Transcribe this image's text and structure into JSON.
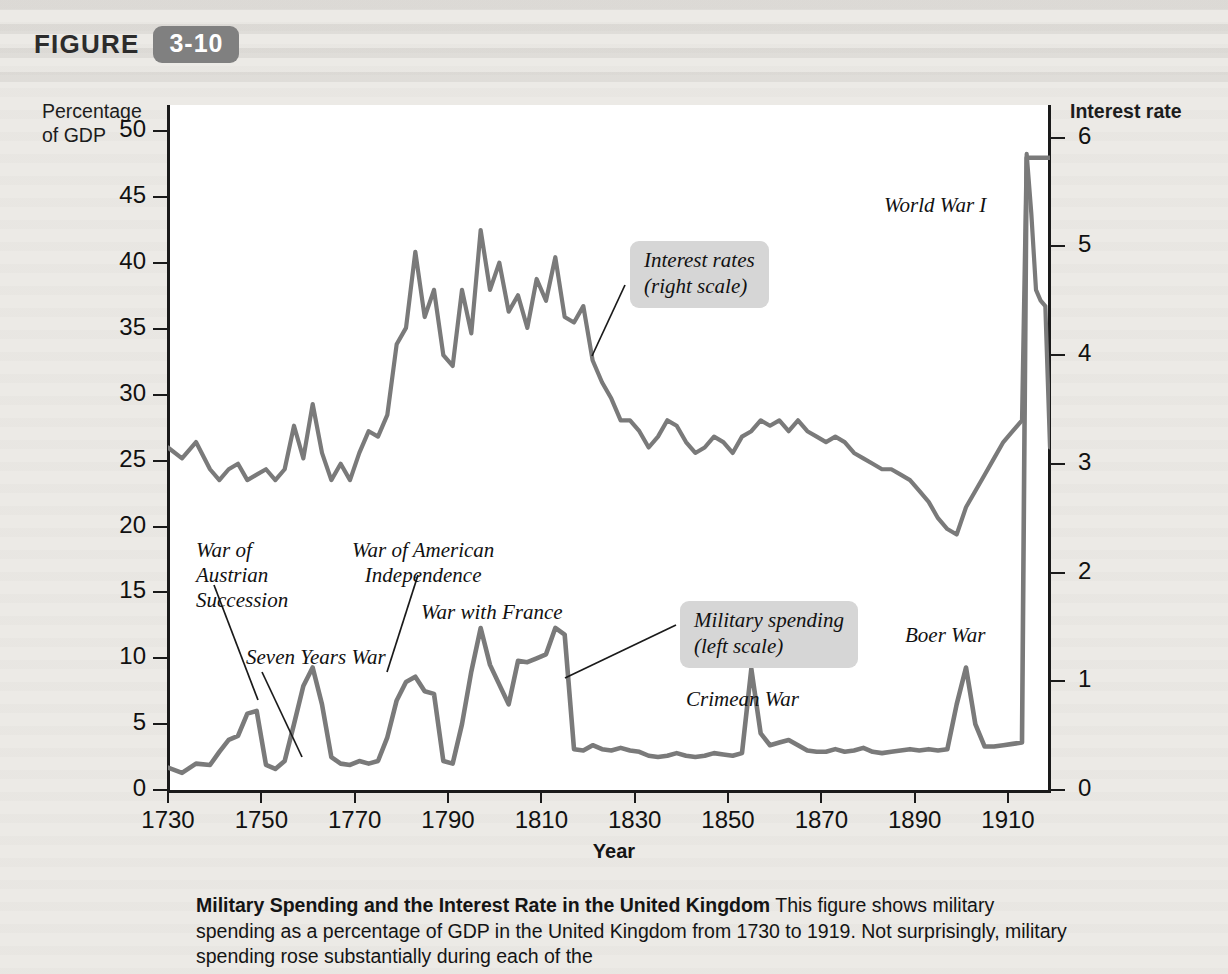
{
  "figure": {
    "word": "FIGURE",
    "number": "3-10",
    "badge_color": "#808080"
  },
  "caption": {
    "title": "Military Spending and the Interest Rate in the United Kingdom",
    "body": " This figure shows military spending as a percentage of GDP in the United Kingdom from 1730 to 1919. Not surprisingly, military spending rose substantially during each of the"
  },
  "chart_data": {
    "type": "line",
    "title": "Military Spending and the Interest Rate in the United Kingdom",
    "xlabel": "Year",
    "ylabel_left": "Percentage of GDP",
    "ylabel_right": "Interest rate",
    "grid": false,
    "legend_position": "inline-callouts",
    "line_color": "#7a7a7a",
    "xlim": [
      1730,
      1919
    ],
    "xticks": [
      1730,
      1750,
      1770,
      1790,
      1810,
      1830,
      1850,
      1870,
      1890,
      1910
    ],
    "left_axis": {
      "ylim": [
        0,
        52
      ],
      "yticks": [
        0,
        5,
        10,
        15,
        20,
        25,
        30,
        35,
        40,
        45,
        50
      ]
    },
    "right_axis": {
      "ylim": [
        0,
        6.3
      ],
      "yticks": [
        0,
        1,
        2,
        3,
        4,
        5,
        6
      ]
    },
    "series": [
      {
        "name": "Interest rates (right scale)",
        "axis": "right",
        "x": [
          1730,
          1733,
          1736,
          1739,
          1741,
          1743,
          1745,
          1747,
          1749,
          1751,
          1753,
          1755,
          1757,
          1759,
          1761,
          1763,
          1765,
          1767,
          1769,
          1771,
          1773,
          1775,
          1777,
          1779,
          1781,
          1783,
          1785,
          1787,
          1789,
          1791,
          1793,
          1795,
          1797,
          1799,
          1801,
          1803,
          1805,
          1807,
          1809,
          1811,
          1813,
          1815,
          1817,
          1819,
          1821,
          1823,
          1825,
          1827,
          1829,
          1831,
          1833,
          1835,
          1837,
          1839,
          1841,
          1843,
          1845,
          1847,
          1849,
          1851,
          1853,
          1855,
          1857,
          1859,
          1861,
          1863,
          1865,
          1867,
          1869,
          1871,
          1873,
          1875,
          1877,
          1879,
          1881,
          1883,
          1885,
          1887,
          1889,
          1891,
          1893,
          1895,
          1897,
          1899,
          1901,
          1903,
          1905,
          1907,
          1909,
          1911,
          1913,
          1914,
          1915,
          1916,
          1917,
          1918,
          1919
        ],
        "values": [
          3.15,
          3.05,
          3.2,
          2.95,
          2.85,
          2.95,
          3.0,
          2.85,
          2.9,
          2.95,
          2.85,
          2.95,
          3.35,
          3.05,
          3.55,
          3.1,
          2.85,
          3.0,
          2.85,
          3.1,
          3.3,
          3.25,
          3.45,
          4.1,
          4.25,
          4.95,
          4.35,
          4.6,
          4.0,
          3.9,
          4.6,
          4.2,
          5.15,
          4.6,
          4.85,
          4.4,
          4.55,
          4.25,
          4.7,
          4.5,
          4.9,
          4.35,
          4.3,
          4.45,
          3.95,
          3.75,
          3.6,
          3.4,
          3.4,
          3.3,
          3.15,
          3.25,
          3.4,
          3.35,
          3.2,
          3.1,
          3.15,
          3.25,
          3.2,
          3.1,
          3.25,
          3.3,
          3.4,
          3.35,
          3.4,
          3.3,
          3.4,
          3.3,
          3.25,
          3.2,
          3.25,
          3.2,
          3.1,
          3.05,
          3.0,
          2.95,
          2.95,
          2.9,
          2.85,
          2.75,
          2.65,
          2.5,
          2.4,
          2.35,
          2.6,
          2.75,
          2.9,
          3.05,
          3.2,
          3.3,
          3.4,
          5.85,
          5.3,
          4.6,
          4.5,
          4.45,
          3.15
        ]
      },
      {
        "name": "Military spending (left scale)",
        "axis": "left",
        "x": [
          1730,
          1733,
          1736,
          1739,
          1741,
          1743,
          1745,
          1747,
          1749,
          1751,
          1753,
          1755,
          1757,
          1759,
          1761,
          1763,
          1765,
          1767,
          1769,
          1771,
          1773,
          1775,
          1777,
          1779,
          1781,
          1783,
          1785,
          1787,
          1789,
          1791,
          1793,
          1795,
          1797,
          1799,
          1801,
          1803,
          1805,
          1807,
          1809,
          1811,
          1813,
          1815,
          1817,
          1819,
          1821,
          1823,
          1825,
          1827,
          1829,
          1831,
          1833,
          1835,
          1837,
          1839,
          1841,
          1843,
          1845,
          1847,
          1849,
          1851,
          1853,
          1855,
          1857,
          1859,
          1861,
          1863,
          1865,
          1867,
          1869,
          1871,
          1873,
          1875,
          1877,
          1879,
          1881,
          1883,
          1885,
          1887,
          1889,
          1891,
          1893,
          1895,
          1897,
          1899,
          1901,
          1903,
          1905,
          1907,
          1909,
          1911,
          1913,
          1914,
          1915,
          1916,
          1917,
          1918,
          1919
        ],
        "values": [
          1.7,
          1.3,
          2.0,
          1.9,
          2.9,
          3.8,
          4.1,
          5.8,
          6.0,
          1.9,
          1.6,
          2.2,
          5.0,
          7.9,
          9.3,
          6.5,
          2.5,
          2.0,
          1.9,
          2.2,
          2.0,
          2.2,
          4.0,
          6.8,
          8.2,
          8.6,
          7.5,
          7.3,
          2.2,
          2.0,
          5.0,
          9.0,
          12.3,
          9.5,
          8.0,
          6.5,
          9.8,
          9.7,
          10.0,
          10.3,
          12.3,
          11.8,
          3.1,
          3.0,
          3.4,
          3.1,
          3.0,
          3.2,
          3.0,
          2.9,
          2.6,
          2.5,
          2.6,
          2.8,
          2.6,
          2.5,
          2.6,
          2.8,
          2.7,
          2.6,
          2.8,
          9.2,
          4.3,
          3.4,
          3.6,
          3.8,
          3.4,
          3.0,
          2.9,
          2.9,
          3.1,
          2.9,
          3.0,
          3.2,
          2.9,
          2.8,
          2.9,
          3.0,
          3.1,
          3.0,
          3.1,
          3.0,
          3.1,
          6.5,
          9.3,
          5.0,
          3.3,
          3.3,
          3.4,
          3.5,
          3.6,
          48.0,
          48.0,
          48.0,
          48.0,
          48.0,
          48.0
        ]
      }
    ],
    "annotations": [
      {
        "name": "war-of-austrian-succession",
        "text_lines": [
          "War of",
          "Austrian",
          "Succession"
        ],
        "style": "plain"
      },
      {
        "name": "seven-years-war",
        "text_lines": [
          "Seven Years War"
        ],
        "style": "plain"
      },
      {
        "name": "war-of-american-independence",
        "text_lines": [
          "War of American",
          "Independence"
        ],
        "style": "plain"
      },
      {
        "name": "war-with-france",
        "text_lines": [
          "War with France"
        ],
        "style": "plain"
      },
      {
        "name": "crimean-war",
        "text_lines": [
          "Crimean War"
        ],
        "style": "plain"
      },
      {
        "name": "boer-war",
        "text_lines": [
          "Boer War"
        ],
        "style": "plain"
      },
      {
        "name": "world-war-i",
        "text_lines": [
          "World War I"
        ],
        "style": "plain"
      },
      {
        "name": "interest-rates-callout",
        "text_lines": [
          "Interest rates",
          "(right scale)"
        ],
        "style": "callout"
      },
      {
        "name": "military-spending-callout",
        "text_lines": [
          "Military spending",
          "(left scale)"
        ],
        "style": "callout"
      }
    ]
  },
  "annotations_text": {
    "austrian_l1": "War of",
    "austrian_l2": "Austrian",
    "austrian_l3": "Succession",
    "seven_years": "Seven Years War",
    "american_l1": "War of American",
    "american_l2": "Independence",
    "war_france": "War with France",
    "crimean": "Crimean War",
    "boer": "Boer War",
    "wwi": "World War I",
    "callout_interest_l1": "Interest rates",
    "callout_interest_l2": "(right scale)",
    "callout_military_l1": "Military spending",
    "callout_military_l2": "(left scale)"
  },
  "axes": {
    "ylabel_left_l1": "Percentage",
    "ylabel_left_l2": "of GDP",
    "ylabel_right": "Interest rate",
    "xlabel": "Year"
  }
}
